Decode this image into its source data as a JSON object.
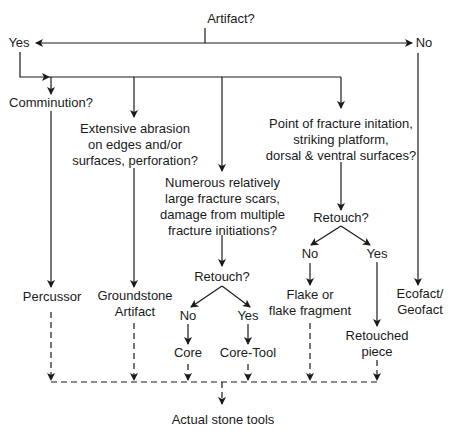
{
  "diagram": {
    "type": "flowchart",
    "title": "Artifact?",
    "nodes": {
      "artifact_q": "Artifact?",
      "yes": "Yes",
      "no": "No",
      "comminution_q": "Comminution?",
      "abrasion_q": [
        "Extensive abrasion",
        "on edges and/or",
        "surfaces, perforation?"
      ],
      "fracture_scars_q": [
        "Numerous relatively",
        "large fracture scars,",
        "damage from multiple",
        "fracture initiations?"
      ],
      "fracture_point_q": [
        "Point of fracture initation,",
        "striking platform,",
        "dorsal & ventral surfaces?"
      ],
      "retouch_core_q": "Retouch?",
      "retouch_core_no": "No",
      "retouch_core_yes": "Yes",
      "core": "Core",
      "core_tool": "Core-Tool",
      "retouch_flake_q": "Retouch?",
      "retouch_flake_no": "No",
      "retouch_flake_yes": "Yes",
      "flake": [
        "Flake or",
        "flake fragment"
      ],
      "retouched_piece": [
        "Retouched",
        "piece"
      ],
      "percussor": "Percussor",
      "groundstone": [
        "Groundstone",
        "Artifact"
      ],
      "ecofact": [
        "Ecofact/",
        "Geofact"
      ],
      "actual_stone_tools": "Actual stone tools"
    },
    "colors": {
      "line": "#1a1a1a",
      "background": "#ffffff"
    }
  }
}
